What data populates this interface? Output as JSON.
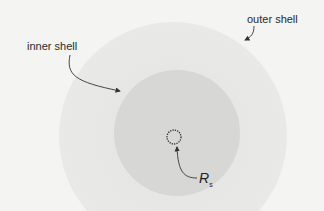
{
  "diagram": {
    "labels": {
      "inner_shell": "inner shell",
      "outer_shell": "outer shell",
      "radius_symbol": "R",
      "radius_subscript": "s"
    },
    "shapes": {
      "outer_shell": {
        "cx": 173,
        "cy": 136,
        "r": 114,
        "fill": "#e6e6e5"
      },
      "inner_shell": {
        "cx": 177,
        "cy": 133,
        "r": 63,
        "fill": "#d6d6d5"
      },
      "core": {
        "cx": 174,
        "cy": 137,
        "r": 7,
        "stroke": "#222222",
        "style": "dotted"
      }
    },
    "colors": {
      "background": "#f4f4f3",
      "arrow": "#333333"
    }
  }
}
